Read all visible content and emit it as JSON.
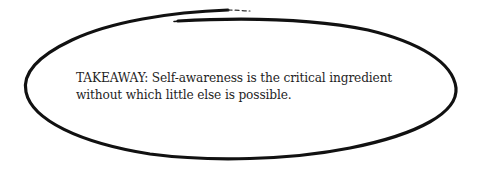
{
  "callout": {
    "shape": "hand-drawn-ellipse",
    "stroke_color": "#111111",
    "background": "#ffffff",
    "text_color": "#1f1f1f",
    "lines": [
      "TAKEAWAY: Self-awareness is the critical ingredient",
      "without which little else is possible."
    ]
  }
}
